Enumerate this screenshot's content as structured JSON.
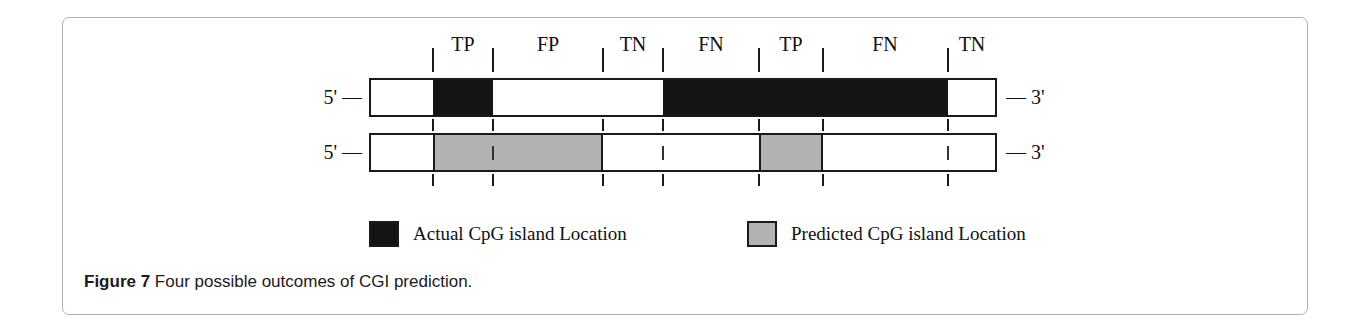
{
  "figure": {
    "caption_label": "Figure 7",
    "caption_text": "Four possible outcomes of CGI prediction.",
    "frame_color": "#aeb0b2"
  },
  "colors": {
    "actual_fill": "#141414",
    "predicted_fill": "#b2b2b2",
    "outline": "#1a1a1a"
  },
  "strands": {
    "actual": {
      "five_prime": "5' —",
      "three_prime": "— 3'"
    },
    "predicted": {
      "five_prime": "5' —",
      "three_prime": "— 3'"
    }
  },
  "segment_labels": [
    {
      "text": "TP",
      "center": 463
    },
    {
      "text": "FP",
      "center": 548
    },
    {
      "text": "TN",
      "center": 633
    },
    {
      "text": "FN",
      "center": 711
    },
    {
      "text": "TP",
      "center": 791
    },
    {
      "text": "FN",
      "center": 885
    },
    {
      "text": "TN",
      "center": 972
    }
  ],
  "legend": [
    {
      "swatch": "actual-swatch",
      "label": "Actual CpG island Location"
    },
    {
      "swatch": "predicted-swatch",
      "label": "Predicted CpG island Location"
    }
  ],
  "chart_data": {
    "type": "diagram",
    "title": "Four possible outcomes of CGI prediction",
    "axis_range": [
      369,
      997
    ],
    "boundaries": [
      433,
      493,
      603,
      663,
      759,
      823,
      948
    ],
    "tracks": [
      {
        "name": "Actual CpG island Location",
        "fill": "#141414",
        "blocks": [
          {
            "start": 433,
            "end": 493
          },
          {
            "start": 663,
            "end": 948
          }
        ]
      },
      {
        "name": "Predicted CpG island Location",
        "fill": "#b2b2b2",
        "blocks": [
          {
            "start": 433,
            "end": 603
          },
          {
            "start": 759,
            "end": 823
          }
        ]
      }
    ],
    "outcomes": [
      {
        "label": "TP",
        "start": 433,
        "end": 493,
        "actual": true,
        "predicted": true
      },
      {
        "label": "FP",
        "start": 493,
        "end": 603,
        "actual": false,
        "predicted": true
      },
      {
        "label": "TN",
        "start": 603,
        "end": 663,
        "actual": false,
        "predicted": false
      },
      {
        "label": "FN",
        "start": 663,
        "end": 759,
        "actual": true,
        "predicted": false
      },
      {
        "label": "TP",
        "start": 759,
        "end": 823,
        "actual": true,
        "predicted": true
      },
      {
        "label": "FN",
        "start": 823,
        "end": 948,
        "actual": true,
        "predicted": false
      },
      {
        "label": "TN",
        "start": 948,
        "end": 997,
        "actual": false,
        "predicted": false
      }
    ]
  }
}
